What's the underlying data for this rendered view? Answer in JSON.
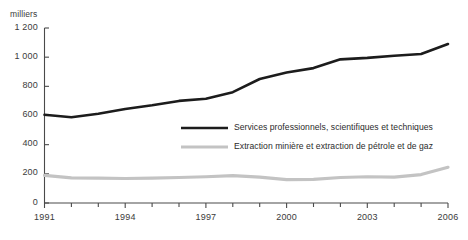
{
  "chart_data": {
    "type": "line",
    "title": "",
    "subtitle": "",
    "xlabel": "",
    "ylabel": "milliers",
    "unit_label": "milliers",
    "x": [
      1991,
      1992,
      1993,
      1994,
      1995,
      1996,
      1997,
      1998,
      1999,
      2000,
      2001,
      2002,
      2003,
      2004,
      2005,
      2006
    ],
    "xlim": [
      1991,
      2006
    ],
    "ylim": [
      0,
      1200
    ],
    "ytick_labels": [
      "0",
      "200",
      "400",
      "600",
      "800",
      "1 000",
      "1 200"
    ],
    "ytick_values": [
      0,
      200,
      400,
      600,
      800,
      1000,
      1200
    ],
    "xtick_labels": [
      "1991",
      "1994",
      "1997",
      "2000",
      "2003",
      "2006"
    ],
    "xtick_values": [
      1991,
      1994,
      1997,
      2000,
      2003,
      2006
    ],
    "minor_xticks_per_year": true,
    "grid": false,
    "legend_position": "inside-center",
    "series": [
      {
        "name": "Services professionnels, scientifiques et techniques",
        "color": "#1c1c1c",
        "width": 2.6,
        "values": [
          605,
          588,
          612,
          645,
          670,
          700,
          715,
          760,
          850,
          895,
          925,
          985,
          995,
          1010,
          1022,
          1090
        ]
      },
      {
        "name": "Extraction minière et extraction de pétrole et de gaz",
        "color": "#c3c3c3",
        "width": 3.2,
        "values": [
          190,
          172,
          170,
          168,
          170,
          175,
          180,
          188,
          178,
          160,
          162,
          175,
          180,
          178,
          195,
          245
        ]
      }
    ]
  },
  "legend": {
    "items": [
      {
        "label": "Services professionnels, scientifiques et techniques",
        "color": "#1c1c1c"
      },
      {
        "label": "Extraction minière et extraction de pétrole et de gaz",
        "color": "#c3c3c3"
      }
    ]
  },
  "footer": {
    "note": ""
  }
}
